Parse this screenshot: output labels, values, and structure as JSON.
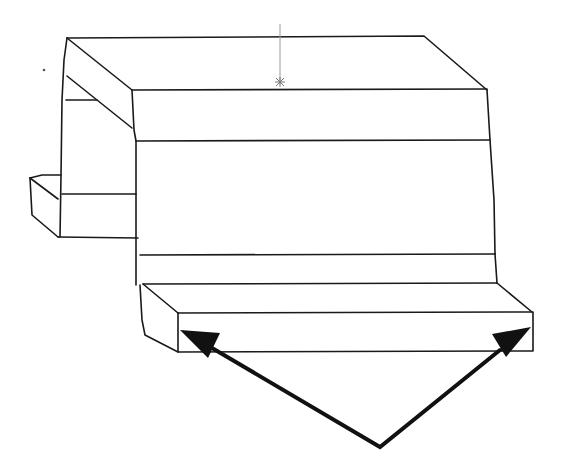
{
  "figure": {
    "type": "isometric CAD line drawing",
    "background": "#ffffff",
    "line_color": "#1a1a1a",
    "annotations": {
      "arrows": {
        "count": 2,
        "apex": [
          380,
          447
        ],
        "targets": [
          [
            182,
            330
          ],
          [
            530,
            328
          ]
        ],
        "color": "#111111",
        "description": "two arrows pointing to the front-left and front-right corners of the lower ledge"
      },
      "origin_marker": {
        "glyph": "*",
        "position": [
          280,
          82
        ],
        "color": "#888888"
      },
      "stray_dot": [
        44,
        70
      ]
    }
  }
}
